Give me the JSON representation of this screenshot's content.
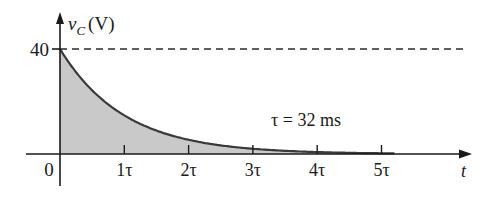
{
  "chart_data": {
    "type": "area",
    "title": "",
    "ylabel": "v",
    "ylabel_sub": "C",
    "ylabel_unit": "(V)",
    "xlabel": "t",
    "y_level_label": "40",
    "y_level": 40,
    "origin_label": "0",
    "x_ticks": [
      "1τ",
      "2τ",
      "3τ",
      "4τ",
      "5τ"
    ],
    "x_tick_values": [
      1,
      2,
      3,
      4,
      5
    ],
    "annotation": "τ = 32 ms",
    "tau_ms": 32,
    "x": [
      0,
      0.5,
      1,
      1.5,
      2,
      2.5,
      3,
      3.5,
      4,
      4.5,
      5
    ],
    "values": [
      40,
      24.26,
      14.72,
      8.93,
      5.41,
      3.28,
      1.99,
      1.21,
      0.73,
      0.44,
      0.27
    ],
    "xlim": [
      0,
      6.3
    ],
    "ylim": [
      0,
      45
    ],
    "grid": false,
    "dashed_reference_at": 40
  }
}
